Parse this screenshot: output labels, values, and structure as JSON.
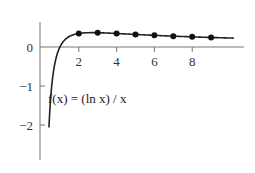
{
  "chart_data": {
    "type": "line",
    "title": "",
    "function_label": "f(x) = (ln x) / x",
    "xlabel": "",
    "ylabel": "",
    "xlim": [
      0,
      10.5
    ],
    "ylim": [
      -2.4,
      0.7
    ],
    "x_ticks": [
      2,
      4,
      6,
      8
    ],
    "x_tick_labels": [
      "2",
      "4",
      "6",
      "8"
    ],
    "y_ticks": [
      0,
      -1,
      -2
    ],
    "y_tick_labels": [
      "0",
      "−1",
      "−2"
    ],
    "grid": false,
    "legend": null,
    "series": [
      {
        "name": "f(x) = (ln x)/x",
        "kind": "curve",
        "x_range": [
          0.42,
          10.2
        ]
      },
      {
        "name": "sampled points",
        "kind": "scatter",
        "x": [
          2,
          3,
          4,
          5,
          6,
          7,
          8,
          9
        ],
        "values": [
          0.347,
          0.366,
          0.347,
          0.322,
          0.299,
          0.278,
          0.26,
          0.244
        ]
      }
    ],
    "colors": {
      "curve": "#222222",
      "axis": "#777777",
      "points": "#111111"
    }
  }
}
